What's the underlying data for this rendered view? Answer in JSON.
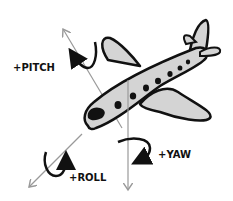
{
  "diagram": {
    "labels": {
      "pitch": "+PITCH",
      "yaw": "+YAW",
      "roll": "+ROLL"
    },
    "colors": {
      "outline": "#111111",
      "fill": "#d4d4d4",
      "axis": "#999999",
      "background": "#ffffff"
    },
    "axes": [
      {
        "name": "pitch-axis",
        "from": [
          124,
          133
        ],
        "to": [
          62,
          28
        ]
      },
      {
        "name": "yaw-axis",
        "from": [
          128,
          80
        ],
        "to": [
          128,
          192
        ]
      },
      {
        "name": "roll-axis",
        "from": [
          82,
          133
        ],
        "to": [
          28,
          188
        ]
      }
    ]
  }
}
